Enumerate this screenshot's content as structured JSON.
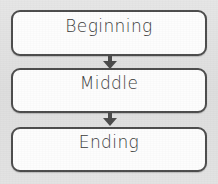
{
  "diagram": {
    "orientation": "vertical",
    "background_color": "#e2e2e2",
    "box_fill_color": "#fdfdfd",
    "box_border_color": "#4c4c4c",
    "text_color": "#3a3a3a",
    "nodes": [
      {
        "id": "beginning",
        "label": "Beginning"
      },
      {
        "id": "middle",
        "label": "Middle"
      },
      {
        "id": "ending",
        "label": "Ending"
      }
    ],
    "connectors": [
      {
        "id": "arrow-beginning-middle",
        "icon": "arrow-down-icon",
        "from": "beginning",
        "to": "middle"
      },
      {
        "id": "arrow-middle-ending",
        "icon": "arrow-down-icon",
        "from": "middle",
        "to": "ending"
      }
    ]
  }
}
